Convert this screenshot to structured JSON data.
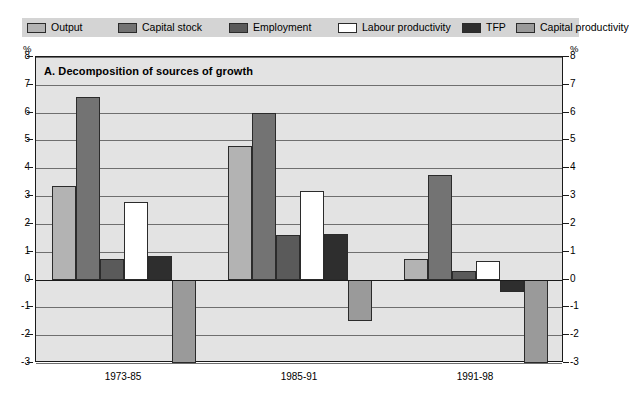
{
  "figure": {
    "panel_title": "A. Decomposition of sources of growth",
    "axis_unit_left": "%",
    "axis_unit_right": "%"
  },
  "legend": {
    "items": [
      {
        "label": "Output",
        "color": "#b3b3b3"
      },
      {
        "label": "Capital stock",
        "color": "#737373"
      },
      {
        "label": "Employment",
        "color": "#5a5a5a"
      },
      {
        "label": "Labour productivity",
        "color": "#ffffff"
      },
      {
        "label": "TFP",
        "color": "#2e2e2e"
      },
      {
        "label": "Capital productivity",
        "color": "#9a9a9a"
      }
    ]
  },
  "chart_data": {
    "type": "bar",
    "title": "A. Decomposition of sources of growth",
    "xlabel": "",
    "ylabel": "%",
    "ylim": [
      -3,
      8
    ],
    "yticks": [
      8,
      7,
      6,
      5,
      4,
      3,
      2,
      1,
      0,
      -1,
      -2,
      -3
    ],
    "ytick_labels": [
      "8",
      "7",
      "6",
      "5",
      "4",
      "3",
      "2",
      "1",
      "0",
      "-1",
      "-2",
      "-3"
    ],
    "grid": true,
    "legend_position": "top",
    "categories": [
      "1973-85",
      "1985-91",
      "1991-98"
    ],
    "series": [
      {
        "name": "Output",
        "color": "#b3b3b3",
        "values": [
          3.35,
          4.8,
          0.75
        ]
      },
      {
        "name": "Capital stock",
        "color": "#737373",
        "values": [
          6.55,
          6.0,
          3.75
        ]
      },
      {
        "name": "Employment",
        "color": "#5a5a5a",
        "values": [
          0.75,
          1.6,
          0.3
        ]
      },
      {
        "name": "Labour productivity",
        "color": "#ffffff",
        "values": [
          2.8,
          3.2,
          0.65
        ]
      },
      {
        "name": "TFP",
        "color": "#2e2e2e",
        "values": [
          0.85,
          1.65,
          -0.45
        ]
      },
      {
        "name": "Capital productivity",
        "color": "#9a9a9a",
        "values": [
          -3.0,
          -1.5,
          -3.0
        ]
      }
    ]
  }
}
